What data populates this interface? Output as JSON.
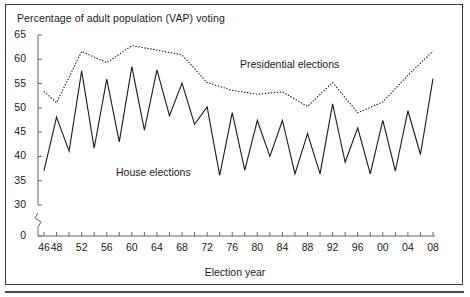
{
  "figure": {
    "title": "Percentage of adult population (VAP) voting",
    "axis_title": "Election year",
    "frame_color": "#3a3a3a",
    "line_color": "#1a1a1a"
  },
  "chart_data": {
    "type": "line",
    "title": "Percentage of adult population (VAP) voting",
    "xlabel": "Election year",
    "ylabel": "Percentage of adult population (VAP) voting",
    "xlim": [
      1946,
      2008
    ],
    "ylim": [
      30,
      65
    ],
    "y_axis_break": true,
    "y_axis_break_note": "Axis broken between 0 and 30",
    "yticks": [
      0,
      30,
      35,
      40,
      45,
      50,
      55,
      60,
      65
    ],
    "ytick_labels": [
      "0",
      "30",
      "35",
      "40",
      "45",
      "50",
      "55",
      "60",
      "65"
    ],
    "xticks": [
      1946,
      1948,
      1950,
      1952,
      1954,
      1956,
      1958,
      1960,
      1962,
      1964,
      1966,
      1968,
      1970,
      1972,
      1974,
      1976,
      1978,
      1980,
      1982,
      1984,
      1986,
      1988,
      1990,
      1992,
      1994,
      1996,
      1998,
      2000,
      2002,
      2004,
      2006,
      2008
    ],
    "xtick_labels": [
      "46",
      "48",
      "",
      "52",
      "",
      "56",
      "",
      "60",
      "",
      "64",
      "",
      "68",
      "",
      "72",
      "",
      "76",
      "",
      "80",
      "",
      "84",
      "",
      "88",
      "",
      "92",
      "",
      "96",
      "",
      "00",
      "",
      "04",
      "",
      "08"
    ],
    "grid": false,
    "legend_position": "inline-annotations",
    "series": [
      {
        "name": "House elections",
        "style": "solid",
        "x": [
          1946,
          1948,
          1950,
          1952,
          1954,
          1956,
          1958,
          1960,
          1962,
          1964,
          1966,
          1968,
          1970,
          1972,
          1974,
          1976,
          1978,
          1980,
          1982,
          1984,
          1986,
          1988,
          1990,
          1992,
          1994,
          1996,
          1998,
          2000,
          2002,
          2004,
          2006,
          2008
        ],
        "values": [
          37.1,
          48.1,
          41.1,
          57.6,
          41.7,
          55.9,
          43.0,
          58.5,
          45.4,
          57.8,
          48.4,
          55.1,
          46.6,
          50.2,
          36.1,
          49.0,
          37.2,
          47.4,
          40.0,
          47.4,
          36.4,
          44.7,
          36.4,
          50.8,
          38.8,
          45.9,
          36.4,
          47.4,
          37.0,
          49.4,
          40.4,
          56.0
        ]
      },
      {
        "name": "Presidential elections",
        "style": "dotted",
        "x": [
          1946,
          1948,
          1952,
          1956,
          1960,
          1964,
          1968,
          1972,
          1976,
          1980,
          1984,
          1988,
          1992,
          1996,
          2000,
          2004,
          2008
        ],
        "values": [
          53.4,
          51.1,
          61.6,
          59.3,
          62.8,
          61.9,
          60.9,
          55.2,
          53.6,
          52.8,
          53.3,
          50.3,
          55.2,
          49.0,
          51.2,
          56.7,
          61.7
        ]
      }
    ],
    "annotations": [
      {
        "text": "House elections",
        "x": 1962,
        "y": 39.5
      },
      {
        "text": "Presidential elections",
        "x": 1982,
        "y": 58.5
      }
    ]
  },
  "y_axis": {
    "labels": [
      "65",
      "60",
      "55",
      "50",
      "45",
      "40",
      "35",
      "30",
      "0"
    ]
  },
  "x_axis": {
    "labels": [
      "46",
      "48",
      "52",
      "56",
      "60",
      "64",
      "68",
      "72",
      "76",
      "80",
      "84",
      "88",
      "92",
      "96",
      "00",
      "04",
      "08"
    ]
  },
  "series_labels": {
    "house": "House elections",
    "presidential": "Presidential elections"
  }
}
